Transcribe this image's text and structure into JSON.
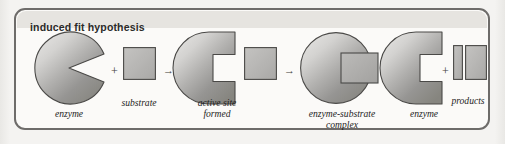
{
  "figure": {
    "title": "induced fit hypothesis",
    "frame_color": "#6e6c6a",
    "background_color": "#fbfaf8",
    "title_strip_color": "#e6e4e0",
    "shape_fill_light": "#d8d7d5",
    "shape_fill_dark": "#8a8987",
    "shape_stroke": "#4a4947"
  },
  "diagram": {
    "type": "process-diagram",
    "caption": "induced fit hypothesis",
    "steps": [
      {
        "id": "step-1",
        "shapes": [
          "enzyme-wedge-notch",
          "substrate-square"
        ],
        "labels": [
          "enzyme",
          "substrate"
        ],
        "operator": "+"
      },
      {
        "id": "step-2",
        "shapes": [
          "enzyme-square-notch",
          "substrate-square"
        ],
        "labels": [
          "active site\nformed"
        ],
        "operator": "→"
      },
      {
        "id": "step-3",
        "shapes": [
          "enzyme-circle-with-bound-substrate"
        ],
        "labels": [
          "enzyme-substrate\ncomplex"
        ],
        "operator": "→"
      },
      {
        "id": "step-4",
        "shapes": [
          "enzyme-square-notch",
          "product-bar-narrow",
          "product-bar-wide"
        ],
        "labels": [
          "enzyme",
          "products"
        ],
        "operator": "+"
      }
    ],
    "operators": {
      "plus": "+",
      "arrow": "→"
    },
    "labels": {
      "enzyme_1": "enzyme",
      "substrate": "substrate",
      "active_site_formed": "active site\nformed",
      "enzyme_substrate_complex": "enzyme-substrate\ncomplex",
      "enzyme_2": "enzyme",
      "products": "products"
    }
  }
}
